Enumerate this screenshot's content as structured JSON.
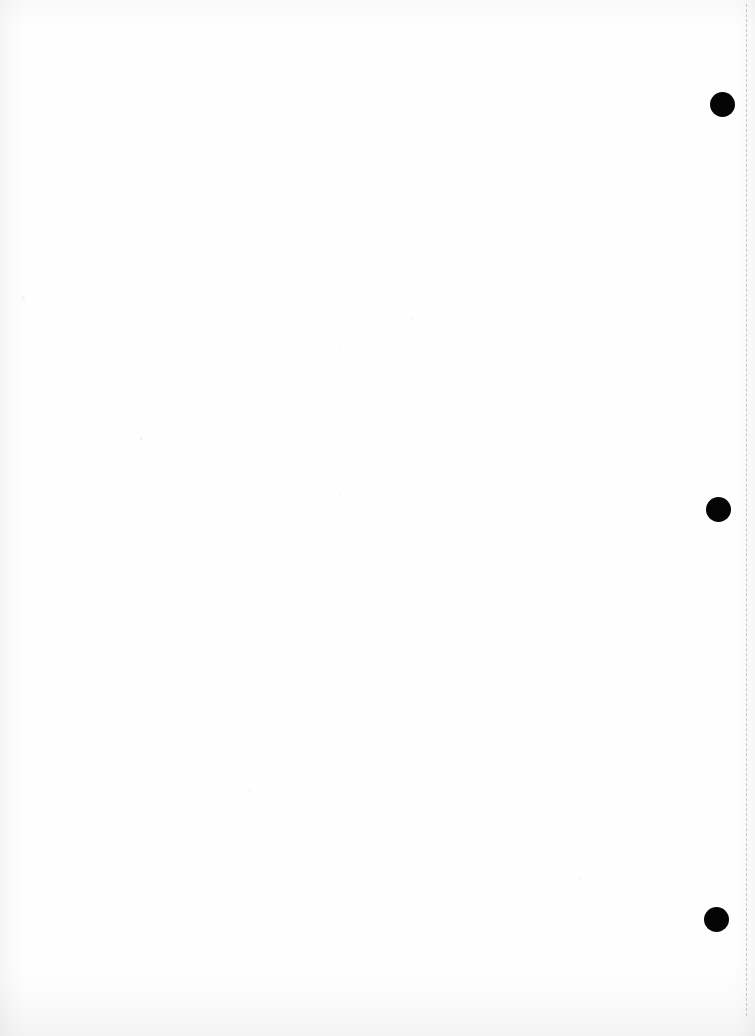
{
  "document": {
    "kind": "scanned-page",
    "title": "Blank scanned page",
    "page_width": 755,
    "page_height": 1036,
    "background_color": "#ffffff",
    "paper_tone": "#fefefe",
    "content_text": "",
    "note": "Page is blank — no printed text, headings, figures or captions are visible."
  },
  "margin_rule": {
    "name": "vertical dashed rule",
    "orientation": "vertical",
    "color": "#c5c5c5",
    "style": "dashed",
    "thickness_px": 1,
    "x_px": 746,
    "top_px": 4,
    "bottom_px": 1016,
    "dash_length_px": 9,
    "dash_gap_px": 8
  },
  "hole_punches": {
    "count": 3,
    "color": "#050505",
    "shape": "circle",
    "items": [
      {
        "label": "top hole punch",
        "center_x": 722,
        "center_y": 104,
        "diameter": 25
      },
      {
        "label": "middle hole punch",
        "center_x": 718,
        "center_y": 509,
        "diameter": 25
      },
      {
        "label": "bottom hole punch",
        "center_x": 716,
        "center_y": 919,
        "diameter": 25
      }
    ]
  },
  "scan_artifacts": {
    "left_edge_shadow": true,
    "right_edge_shadow": true,
    "top_edge_shadow": true,
    "bottom_edge_shadow": true,
    "specks": [
      {
        "x": 140,
        "y": 437,
        "size": 3
      },
      {
        "x": 412,
        "y": 318,
        "size": 2
      },
      {
        "x": 340,
        "y": 349,
        "size": 2
      },
      {
        "x": 339,
        "y": 493,
        "size": 2
      },
      {
        "x": 22,
        "y": 296,
        "size": 3
      },
      {
        "x": 580,
        "y": 878,
        "size": 2
      },
      {
        "x": 249,
        "y": 790,
        "size": 2
      }
    ]
  }
}
